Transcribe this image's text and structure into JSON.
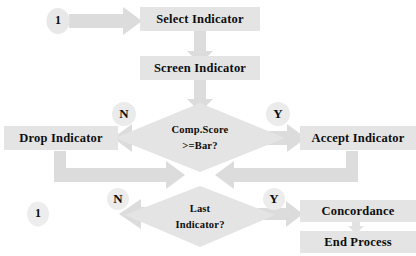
{
  "diagram": {
    "type": "flowchart",
    "background_color": "#ffffff",
    "shape_fill": "#e4e4e4",
    "arrow_fill": "#dcdcdc",
    "text_color": "#0d0d0d"
  },
  "nodes": {
    "start_connector": {
      "label": "1",
      "shape": "circle",
      "x": 58,
      "y": 20
    },
    "select_indicator": {
      "label": "Select Indicator",
      "shape": "process",
      "x": 200,
      "y": 19
    },
    "screen_indicator": {
      "label": "Screen Indicator",
      "shape": "process",
      "x": 200,
      "y": 68
    },
    "comp_score_decision": {
      "line1": "Comp.Score",
      "line2": ">=Bar?",
      "shape": "decision",
      "x": 200,
      "y": 134
    },
    "drop_indicator": {
      "label": "Drop Indicator",
      "shape": "process",
      "x": 61,
      "y": 137
    },
    "accept_indicator": {
      "label": "Accept Indicator",
      "shape": "process",
      "x": 352,
      "y": 137
    },
    "last_indicator_decision": {
      "line1": "Last",
      "line2": "Indicator?",
      "shape": "decision",
      "x": 200,
      "y": 216
    },
    "loop_connector": {
      "label": "1",
      "shape": "circle",
      "x": 38,
      "y": 212
    },
    "concordance": {
      "label": "Concordance",
      "shape": "process",
      "x": 356,
      "y": 211
    },
    "end_process": {
      "label": "End Process",
      "shape": "process",
      "x": 356,
      "y": 241
    }
  },
  "branch_labels": {
    "comp_no": {
      "label": "N",
      "x": 124,
      "y": 114
    },
    "comp_yes": {
      "label": "Y",
      "x": 277,
      "y": 114
    },
    "last_no": {
      "label": "N",
      "x": 118,
      "y": 198
    },
    "last_yes": {
      "label": "Y",
      "x": 273,
      "y": 198
    }
  },
  "edges": [
    {
      "name": "start-to-select",
      "from": "start_connector",
      "to": "select_indicator",
      "label": ""
    },
    {
      "name": "select-to-screen",
      "from": "select_indicator",
      "to": "screen_indicator",
      "label": ""
    },
    {
      "name": "screen-to-comp",
      "from": "screen_indicator",
      "to": "comp_score_decision",
      "label": ""
    },
    {
      "name": "comp-no-to-drop",
      "from": "comp_score_decision",
      "to": "drop_indicator",
      "label": "N"
    },
    {
      "name": "comp-yes-to-accept",
      "from": "comp_score_decision",
      "to": "accept_indicator",
      "label": "Y"
    },
    {
      "name": "drop-to-last",
      "from": "drop_indicator",
      "to": "last_indicator_decision",
      "label": ""
    },
    {
      "name": "accept-to-last",
      "from": "accept_indicator",
      "to": "last_indicator_decision",
      "label": ""
    },
    {
      "name": "last-no-to-loop",
      "from": "last_indicator_decision",
      "to": "loop_connector",
      "label": "N"
    },
    {
      "name": "last-yes-to-concordance",
      "from": "last_indicator_decision",
      "to": "concordance",
      "label": "Y"
    },
    {
      "name": "concordance-to-end",
      "from": "concordance",
      "to": "end_process",
      "label": ""
    }
  ]
}
